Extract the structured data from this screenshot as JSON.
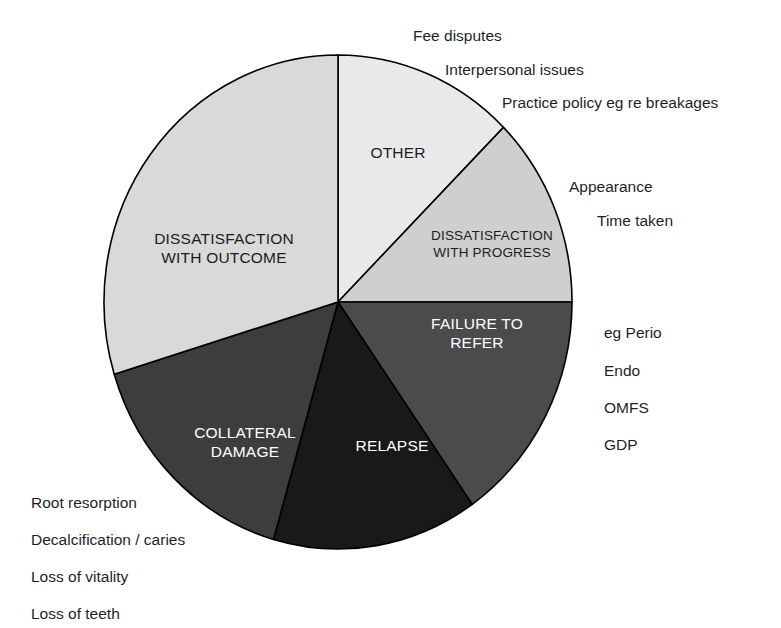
{
  "chart_data": {
    "type": "pie",
    "title": "",
    "subtitle": "",
    "xlabel": "",
    "ylabel": "",
    "legend_position": "none",
    "grid": false,
    "start_angle_deg": 0,
    "direction": "clockwise",
    "units": "percent",
    "total": 100,
    "categories": [
      "OTHER",
      "DISSATISFACTION WITH PROGRESS",
      "FAILURE TO REFER",
      "RELAPSE",
      "COLLATERAL DAMAGE",
      "DISSATISFACTION WITH OUTCOME"
    ],
    "values": [
      12.5,
      12.5,
      15.3,
      14.2,
      15.8,
      29.7
    ],
    "colors": [
      "#e9e9e9",
      "#cfcfcf",
      "#4b4b4b",
      "#191919",
      "#3d3d3d",
      "#d9d9d9"
    ],
    "slices": [
      {
        "label": "OTHER",
        "label_lines": [
          "OTHER"
        ],
        "value": 12.5,
        "start_deg": 0,
        "end_deg": 45,
        "color": "#e9e9e9",
        "text_color": "#1c1c1c",
        "label_x": 398,
        "label_y": 154,
        "label_align": "middle",
        "label_size": "normal",
        "annotations": [
          "Fee disputes",
          "Interpersonal issues",
          "Practice policy eg re breakages"
        ]
      },
      {
        "label": "DISSATISFACTION WITH PROGRESS",
        "label_lines": [
          "DISSATISFACTION",
          "WITH PROGRESS"
        ],
        "value": 12.5,
        "start_deg": 45,
        "end_deg": 90,
        "color": "#cfcfcf",
        "text_color": "#1c1c1c",
        "label_x": 492,
        "label_y": 244,
        "label_align": "middle",
        "label_size": "small",
        "annotations": [
          "Appearance",
          "Time taken"
        ]
      },
      {
        "label": "FAILURE TO REFER",
        "label_lines": [
          "FAILURE TO",
          "REFER"
        ],
        "value": 15.3,
        "start_deg": 90,
        "end_deg": 145,
        "color": "#4b4b4b",
        "text_color": "#ffffff",
        "label_x": 477,
        "label_y": 334,
        "label_align": "middle",
        "label_size": "normal",
        "annotations": [
          "eg Perio",
          "Endo",
          "OMFS",
          "GDP"
        ]
      },
      {
        "label": "RELAPSE",
        "label_lines": [
          "RELAPSE"
        ],
        "value": 14.2,
        "start_deg": 145,
        "end_deg": 196,
        "color": "#191919",
        "text_color": "#ffffff",
        "label_x": 392,
        "label_y": 447,
        "label_align": "middle",
        "label_size": "normal",
        "annotations": []
      },
      {
        "label": "COLLATERAL DAMAGE",
        "label_lines": [
          "COLLATERAL",
          "DAMAGE"
        ],
        "value": 15.8,
        "start_deg": 196,
        "end_deg": 253,
        "color": "#3d3d3d",
        "text_color": "#ffffff",
        "label_x": 245,
        "label_y": 443,
        "label_align": "middle",
        "label_size": "normal",
        "annotations": [
          "Root resorption",
          "Decalcification / caries",
          "Loss of vitality",
          "Loss of teeth"
        ]
      },
      {
        "label": "DISSATISFACTION WITH OUTCOME",
        "label_lines": [
          "DISSATISFACTION",
          "WITH OUTCOME"
        ],
        "value": 29.7,
        "start_deg": 253,
        "end_deg": 360,
        "color": "#d9d9d9",
        "text_color": "#1c1c1c",
        "label_x": 224,
        "label_y": 249,
        "label_align": "middle",
        "label_size": "normal",
        "annotations": []
      }
    ],
    "geometry": {
      "center_x": 338,
      "center_y": 302,
      "radius_x": 234,
      "radius_y": 247,
      "stroke": "#000000",
      "stroke_width": 1.6
    },
    "annotations": [
      {
        "text": "Fee disputes",
        "x": 413,
        "y": 28,
        "group": "OTHER"
      },
      {
        "text": "Interpersonal issues",
        "x": 445,
        "y": 62,
        "group": "OTHER"
      },
      {
        "text": "Practice policy eg re breakages",
        "x": 502,
        "y": 95,
        "group": "OTHER"
      },
      {
        "text": "Appearance",
        "x": 569,
        "y": 179,
        "group": "DISSATISFACTION WITH PROGRESS"
      },
      {
        "text": "Time taken",
        "x": 597,
        "y": 213,
        "group": "DISSATISFACTION WITH PROGRESS"
      },
      {
        "text": "eg Perio",
        "x": 604,
        "y": 325,
        "group": "FAILURE TO REFER"
      },
      {
        "text": "Endo",
        "x": 604,
        "y": 363,
        "group": "FAILURE TO REFER"
      },
      {
        "text": "OMFS",
        "x": 604,
        "y": 400,
        "group": "FAILURE TO REFER"
      },
      {
        "text": "GDP",
        "x": 604,
        "y": 437,
        "group": "FAILURE TO REFER"
      },
      {
        "text": "Root resorption",
        "x": 31,
        "y": 495,
        "group": "COLLATERAL DAMAGE"
      },
      {
        "text": "Decalcification / caries",
        "x": 31,
        "y": 532,
        "group": "COLLATERAL DAMAGE"
      },
      {
        "text": "Loss of vitality",
        "x": 31,
        "y": 569,
        "group": "COLLATERAL DAMAGE"
      },
      {
        "text": "Loss of teeth",
        "x": 31,
        "y": 606,
        "group": "COLLATERAL DAMAGE"
      }
    ]
  }
}
